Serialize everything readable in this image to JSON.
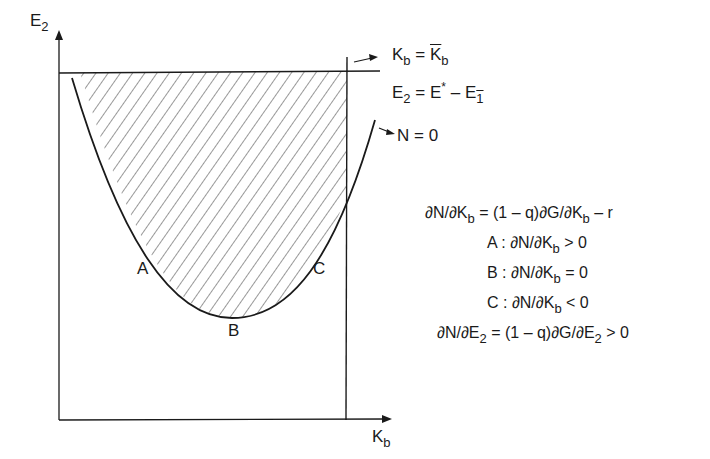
{
  "axes": {
    "y_label": "E",
    "y_label_sub": "2",
    "x_label": "K",
    "x_label_sub": "b"
  },
  "lines": {
    "vertical": {
      "lhs": "K",
      "lhs_sub": "b",
      "eq": "=",
      "rhs": "K",
      "rhs_sub": "b",
      "rhs_bar": true
    },
    "horizontal": {
      "lhs": "E",
      "lhs_sub": "2",
      "eq": "=",
      "rhs1": "E",
      "rhs1_sup": "*",
      "minus": "–",
      "rhs2": "E",
      "rhs2_sub": "1",
      "rhs2_bar": true
    },
    "curve": {
      "label": "N = 0"
    }
  },
  "points": {
    "A": "A",
    "B": "B",
    "C": "C"
  },
  "equations": {
    "eq1": "∂N/∂K",
    "eq1_sub": "b",
    "eq1_rhs": " = (1 – q)∂G/∂K",
    "eq1_rhs_sub": "b",
    "eq1_tail": " – r",
    "condA_prefix": "A :  ∂N/∂K",
    "condA_sub": "b",
    "condA_tail": " > 0",
    "condB_prefix": "B :  ∂N/∂K",
    "condB_sub": "b",
    "condB_tail": "  =  0",
    "condC_prefix": "C :  ∂N/∂K",
    "condC_sub": "b",
    "condC_tail": " < 0",
    "eq2": "∂N/∂E",
    "eq2_sub": "2",
    "eq2_rhs": " = (1 – q)∂G/∂E",
    "eq2_rhs_sub": "2",
    "eq2_tail": " > 0"
  },
  "colors": {
    "ink": "#1a1a1a",
    "background": "#ffffff"
  }
}
